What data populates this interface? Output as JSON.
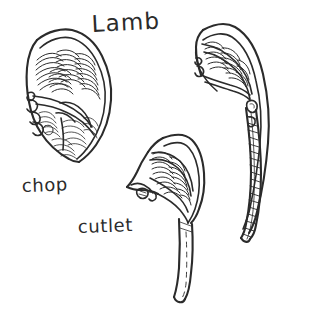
{
  "document": {
    "kind": "hand-drawn-illustration",
    "subject": "Lamb cuts diagram",
    "background_color": "#ffffff",
    "ink_color": "#2b2b2b",
    "width": 312,
    "height": 321
  },
  "title": {
    "text": "Lamb",
    "x": 92,
    "y": 32
  },
  "captions": [
    {
      "key": "chop",
      "text": "chop",
      "x": 22,
      "y": 192
    },
    {
      "key": "cutlet",
      "text": "cutlet",
      "x": 78,
      "y": 233
    }
  ],
  "figures": [
    {
      "key": "chop",
      "name": "lamb-chop-drawing",
      "caption": "chop",
      "description": "Loin chop cross-section with outer fat rind, vertebra bone at left and hatched muscle eye"
    },
    {
      "key": "cutlet",
      "name": "lamb-cutlet-drawing",
      "caption": "cutlet",
      "description": "Small cutlet with hatched meat eye and a long trimmed rib bone with dashed centre line"
    },
    {
      "key": "best-end",
      "name": "lamb-best-end-drawing",
      "caption": "",
      "description": "Curved best-end cut with long curved rib bone and fat band along the outer edge"
    }
  ]
}
